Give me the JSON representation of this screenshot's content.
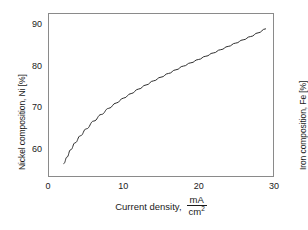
{
  "chart_data": {
    "type": "line",
    "title": "",
    "xlabel": "Current density,",
    "xunits_numerator": "mA",
    "xunits_denominator": "cm",
    "xunits_denominator_exp": "2",
    "ylabel_left": "Nickel composition, Ni [%]",
    "ylabel_right": "Iron composition, Fe [%]",
    "xlim": [
      0,
      30
    ],
    "xticks": [
      0,
      10,
      20,
      30
    ],
    "xticklabels": [
      "0",
      "10",
      "20",
      "30"
    ],
    "ylim_left": [
      93,
      53.5
    ],
    "yticks_left": [
      60,
      70,
      80,
      90
    ],
    "yticklabels_left": [
      "60",
      "70",
      "80",
      "90"
    ],
    "ylim_right": [
      7,
      46.5
    ],
    "yticks_right": [
      40,
      30,
      20,
      10
    ],
    "yticklabels_right": [
      "40",
      "30",
      "20",
      "10"
    ],
    "y_left_inverted": true,
    "grid": false,
    "legend": null,
    "series": [
      {
        "name": "Ni composition vs current density",
        "color": "#2b2b2b",
        "x": [
          2.0,
          2.4,
          2.9,
          3.5,
          4.2,
          5.0,
          6.0,
          7.0,
          8.0,
          9.0,
          10.0,
          11.0,
          12.0,
          13.0,
          14.0,
          15.0,
          16.0,
          17.0,
          18.0,
          19.0,
          20.0,
          21.0,
          22.0,
          23.0,
          24.0,
          25.0,
          26.0,
          27.0,
          28.0,
          29.0
        ],
        "y_ni": [
          56.5,
          58.1,
          59.9,
          61.6,
          63.3,
          65.0,
          66.9,
          68.5,
          70.0,
          71.3,
          72.5,
          73.6,
          74.7,
          75.7,
          76.7,
          77.6,
          78.5,
          79.4,
          80.3,
          81.1,
          81.9,
          82.7,
          83.5,
          84.3,
          85.1,
          85.9,
          86.7,
          87.5,
          88.4,
          89.4
        ],
        "y_fe": [
          43.5,
          41.9,
          40.1,
          38.4,
          36.7,
          35.0,
          33.1,
          31.5,
          30.0,
          28.7,
          27.5,
          26.4,
          25.3,
          24.3,
          23.3,
          22.4,
          21.5,
          20.6,
          19.7,
          18.9,
          18.1,
          17.3,
          16.5,
          15.7,
          14.9,
          14.1,
          13.3,
          12.5,
          11.6,
          10.6
        ]
      }
    ]
  },
  "style": {
    "frame_color": "#8a8a8a",
    "curve_color": "#2b2b2b",
    "text_color": "#1a1a1a",
    "background": "#ffffff"
  }
}
